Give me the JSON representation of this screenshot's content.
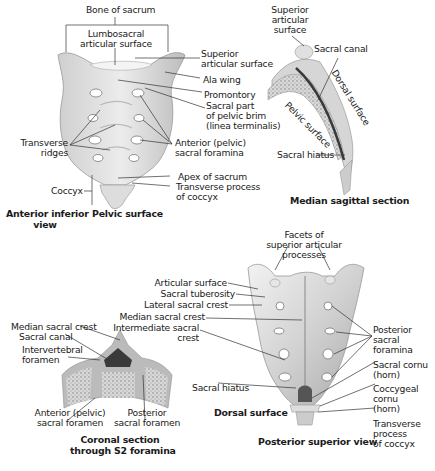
{
  "figure": {
    "anterior": {
      "bone_of_sacrum": "Bone of sacrum",
      "lumbosacral_1": "Lumbosacral",
      "lumbosacral_2": "articular surface",
      "superior_articular_1": "Superior",
      "superior_articular_2": "articular surface",
      "ala_wing": "Ala wing",
      "promontory": "Promontory",
      "sacral_part_1": "Sacral part",
      "sacral_part_2": "of pelvic brim",
      "sacral_part_3": "(linea terminalis)",
      "transverse_ridges_1": "Transverse",
      "transverse_ridges_2": "ridges",
      "anterior_foramina_1": "Anterior (pelvic)",
      "anterior_foramina_2": "sacral foramina",
      "apex": "Apex of sacrum",
      "coccyx": "Coccyx",
      "transverse_process_1": "Transverse process",
      "transverse_process_2": "of coccyx",
      "view_1": "Anterior inferior",
      "view_2": "view",
      "surface": "Pelvic surface"
    },
    "sagittal": {
      "superior_1": "Superior",
      "superior_2": "articular",
      "superior_3": "surface",
      "sacral_canal": "Sacral canal",
      "dorsal_surface": "Dorsal surface",
      "pelvic_surface": "Pelvic surface",
      "sacral_hiatus": "Sacral hiatus",
      "title": "Median sagittal section"
    },
    "coronal": {
      "median_crest": "Median sacral crest",
      "sacral_canal": "Sacral canal",
      "intervertebral_1": "Intervertebral",
      "intervertebral_2": "foramen",
      "anterior_1": "Anterior (pelvic)",
      "anterior_2": "sacral foramen",
      "posterior_1": "Posterior",
      "posterior_2": "sacral foramen",
      "title_1": "Coronal section",
      "title_2": "through S2 foramina"
    },
    "posterior": {
      "facets_1": "Facets of",
      "facets_2": "superior articular",
      "facets_3": "processes",
      "articular_surface": "Articular surface",
      "sacral_tuberosity": "Sacral tuberosity",
      "lateral_crest": "Lateral sacral crest",
      "median_crest": "Median sacral crest",
      "intermediate_1": "Intermediate sacral",
      "intermediate_2": "crest",
      "posterior_foramina_1": "Posterior",
      "posterior_foramina_2": "sacral",
      "posterior_foramina_3": "foramina",
      "sacral_cornu_1": "Sacral cornu",
      "sacral_cornu_2": "(horn)",
      "coccygeal_cornu_1": "Coccygeal",
      "coccygeal_cornu_2": "cornu",
      "coccygeal_cornu_3": "(horn)",
      "transverse_1": "Transverse",
      "transverse_2": "process",
      "transverse_3": "of coccyx",
      "sacral_hiatus": "Sacral hiatus",
      "surface": "Dorsal surface",
      "view": "Posterior superior view"
    },
    "colors": {
      "bone_light": "#e6e6e6",
      "bone_mid": "#c4c4c4",
      "bone_dark": "#8a8a8a",
      "canal": "#3a3a3a",
      "leader": "#333333"
    }
  }
}
